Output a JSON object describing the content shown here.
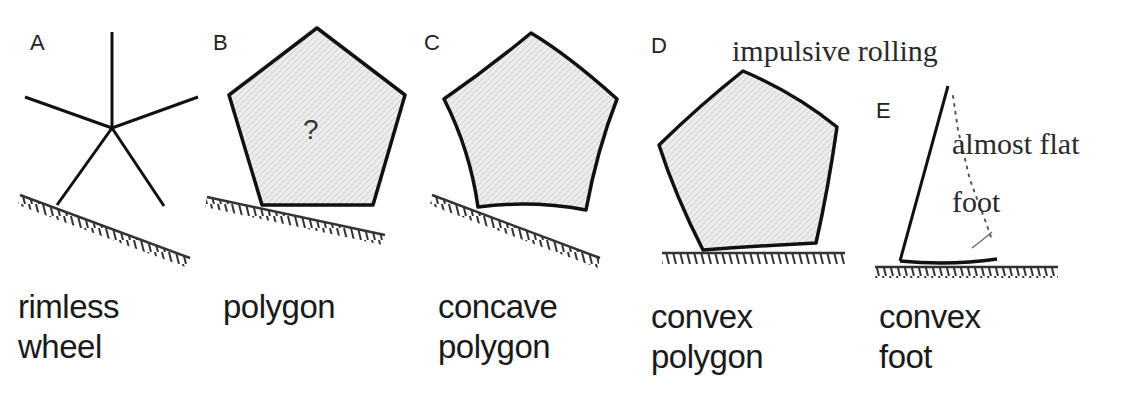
{
  "figure": {
    "panels": [
      {
        "letter": "A",
        "caption_line1": "rimless",
        "caption_line2": "wheel"
      },
      {
        "letter": "B",
        "caption_line1": "polygon",
        "caption_line2": "",
        "center_mark": "?"
      },
      {
        "letter": "C",
        "caption_line1": "concave",
        "caption_line2": "polygon"
      },
      {
        "letter": "D",
        "caption_line1": "convex",
        "caption_line2": "polygon",
        "annotation": "impulsive rolling"
      },
      {
        "letter": "E",
        "caption_line1": "convex",
        "caption_line2": "foot",
        "annotation_line1": "almost flat",
        "annotation_line2": "foot"
      }
    ],
    "colors": {
      "stroke": "#111111",
      "fill": "#e6e6e6",
      "background": "#ffffff"
    }
  }
}
